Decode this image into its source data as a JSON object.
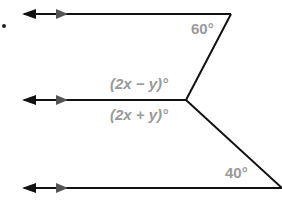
{
  "figure": {
    "bullet": "•",
    "angles": {
      "top": "60°",
      "middle_upper": "(2x − y)°",
      "middle_lower": "(2x + y)°",
      "bottom": "40°"
    },
    "colors": {
      "line": "#111111",
      "label": "#9a9a9a",
      "arrow_secondary": "#555555"
    }
  }
}
